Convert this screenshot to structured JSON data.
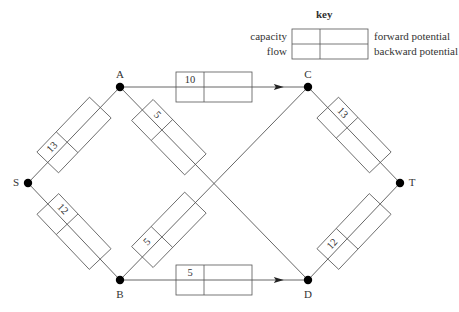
{
  "key": {
    "title": "key",
    "labels": {
      "top_left": "capacity",
      "bottom_left": "flow",
      "top_right": "forward potential",
      "bottom_right": "backward potential"
    }
  },
  "nodes": [
    {
      "id": "S",
      "label": "S"
    },
    {
      "id": "A",
      "label": "A"
    },
    {
      "id": "B",
      "label": "B"
    },
    {
      "id": "C",
      "label": "C"
    },
    {
      "id": "D",
      "label": "D"
    },
    {
      "id": "T",
      "label": "T"
    }
  ],
  "edges": [
    {
      "from": "S",
      "to": "A",
      "capacity": "13",
      "directed": false
    },
    {
      "from": "S",
      "to": "B",
      "capacity": "12",
      "directed": false
    },
    {
      "from": "A",
      "to": "C",
      "capacity": "10",
      "directed": true
    },
    {
      "from": "A",
      "to": "D",
      "capacity": "5",
      "directed": false
    },
    {
      "from": "B",
      "to": "C",
      "capacity": "5",
      "directed": false
    },
    {
      "from": "B",
      "to": "D",
      "capacity": "5",
      "directed": true
    },
    {
      "from": "C",
      "to": "T",
      "capacity": "13",
      "directed": false
    },
    {
      "from": "D",
      "to": "T",
      "capacity": "12",
      "directed": false
    }
  ],
  "colors": {
    "line": "#555555",
    "node": "#000000",
    "text": "#333333"
  }
}
